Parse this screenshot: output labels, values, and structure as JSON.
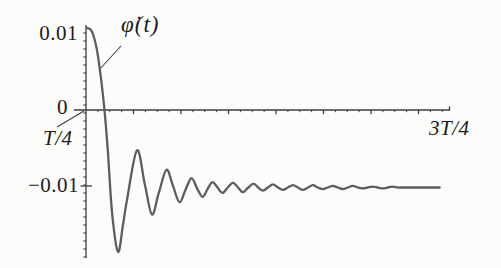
{
  "figure": {
    "background": "#fcfcfa",
    "curve_color": "#5d5d5d",
    "axis_color": "#3e3e3e",
    "text_color": "#1b1b1b"
  },
  "labels": {
    "curve": "φ̇(t)",
    "y_max": "0.01",
    "zero": "0",
    "y_min": "−0.01",
    "x_start": "T/4",
    "x_end": "3T/4"
  },
  "chart_data": {
    "type": "line",
    "title": "",
    "xlabel": "t",
    "ylabel": "φ̇(t)",
    "x_axis": {
      "start_label": "T/4",
      "end_label": "3T/4",
      "range_in_periods": [
        0.25,
        0.75
      ]
    },
    "y_axis": {
      "tick_labels": [
        "0.01",
        "0",
        "−0.01"
      ],
      "tick_values": [
        0.01,
        0,
        -0.01
      ],
      "asymptote": -0.01
    },
    "series": [
      {
        "name": "φ̇(t)",
        "points": [
          [
            0.2514,
            0.0106
          ],
          [
            0.256,
            0.0104
          ],
          [
            0.26,
            0.0097
          ],
          [
            0.265,
            0.0078
          ],
          [
            0.27,
            0.0046
          ],
          [
            0.2755,
            0.0
          ],
          [
            0.28,
            -0.0052
          ],
          [
            0.286,
            -0.0133
          ],
          [
            0.2941,
            -0.0183
          ],
          [
            0.301,
            -0.0148
          ],
          [
            0.3065,
            -0.0116
          ],
          [
            0.3202,
            -0.0052
          ],
          [
            0.3312,
            -0.0097
          ],
          [
            0.3409,
            -0.0135
          ],
          [
            0.3505,
            -0.0106
          ],
          [
            0.3609,
            -0.0077
          ],
          [
            0.3698,
            -0.0098
          ],
          [
            0.3788,
            -0.0119
          ],
          [
            0.3871,
            -0.0103
          ],
          [
            0.3953,
            -0.0088
          ],
          [
            0.4029,
            -0.0101
          ],
          [
            0.4105,
            -0.0112
          ],
          [
            0.4174,
            -0.0102
          ],
          [
            0.4242,
            -0.0093
          ],
          [
            0.4311,
            -0.01
          ],
          [
            0.438,
            -0.0107
          ],
          [
            0.4452,
            -0.01
          ],
          [
            0.4525,
            -0.0094
          ],
          [
            0.4594,
            -0.01
          ],
          [
            0.4662,
            -0.0106
          ],
          [
            0.4735,
            -0.01
          ],
          [
            0.4807,
            -0.0095
          ],
          [
            0.4872,
            -0.01
          ],
          [
            0.4938,
            -0.0104
          ],
          [
            0.5006,
            -0.01
          ],
          [
            0.5075,
            -0.0096
          ],
          [
            0.5144,
            -0.01
          ],
          [
            0.5213,
            -0.0103
          ],
          [
            0.5281,
            -0.01
          ],
          [
            0.535,
            -0.0097
          ],
          [
            0.5419,
            -0.01
          ],
          [
            0.5488,
            -0.0103
          ],
          [
            0.5556,
            -0.01
          ],
          [
            0.5625,
            -0.0097
          ],
          [
            0.5694,
            -0.01
          ],
          [
            0.5763,
            -0.0102
          ],
          [
            0.5831,
            -0.01
          ],
          [
            0.59,
            -0.0098
          ],
          [
            0.5969,
            -0.01
          ],
          [
            0.6038,
            -0.0102
          ],
          [
            0.6106,
            -0.01
          ],
          [
            0.6175,
            -0.0098
          ],
          [
            0.6244,
            -0.01
          ],
          [
            0.6312,
            -0.0101
          ],
          [
            0.6381,
            -0.01
          ],
          [
            0.645,
            -0.0099
          ],
          [
            0.6519,
            -0.01
          ],
          [
            0.6587,
            -0.0101
          ],
          [
            0.6656,
            -0.01
          ],
          [
            0.6725,
            -0.0099
          ],
          [
            0.6794,
            -0.01
          ],
          [
            0.6862,
            -0.01
          ],
          [
            0.6931,
            -0.01
          ],
          [
            0.7,
            -0.01
          ],
          [
            0.715,
            -0.01
          ],
          [
            0.7372,
            -0.01
          ]
        ]
      }
    ],
    "legend": null,
    "grid": false
  }
}
